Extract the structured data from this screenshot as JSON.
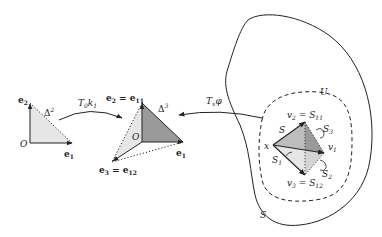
{
  "figure": {
    "left_simplex": {
      "name": "Δ",
      "dim": "2",
      "origin": "O",
      "e1": "e",
      "e1_sub": "1",
      "e2": "e",
      "e2_sub": "2"
    },
    "arrow_left": {
      "label": "T",
      "label_sub": "0",
      "label2": "k",
      "label2_sub": "1"
    },
    "middle_simplex": {
      "name": "Δ",
      "dim": "3",
      "origin": "O",
      "e1": "e",
      "e1_sub": "1",
      "e2_label": "e",
      "e2_sub": "2",
      "e2_eq": " = e",
      "e2_eq_sub": "11",
      "e3_label": "e",
      "e3_sub": "3",
      "e3_eq": " = e",
      "e3_eq_sub": "12"
    },
    "arrow_right": {
      "label": "T",
      "label_sub": "x",
      "label2": "φ"
    },
    "manifold": {
      "outer_label": "S",
      "neighborhood_label": "U",
      "point": "x",
      "v1": "v",
      "v1_sub": "1",
      "v2": "v",
      "v2_sub": "2",
      "v2_eq": " = S",
      "v2_eq_sub": "11",
      "v3": "v",
      "v3_sub": "3",
      "v3_eq": " = S",
      "v3_eq_sub": "12",
      "face_S": "S",
      "face_S1": "S",
      "face_S1_sub": "1",
      "face_S2": "S",
      "face_S2_sub": "2",
      "face_S3": "S",
      "face_S3_sub": "3"
    },
    "colors": {
      "line": "#222222",
      "light_fill": "#e6e6e6",
      "mid_fill": "#bdbdbd",
      "dark_fill": "#9a9a9a"
    }
  }
}
